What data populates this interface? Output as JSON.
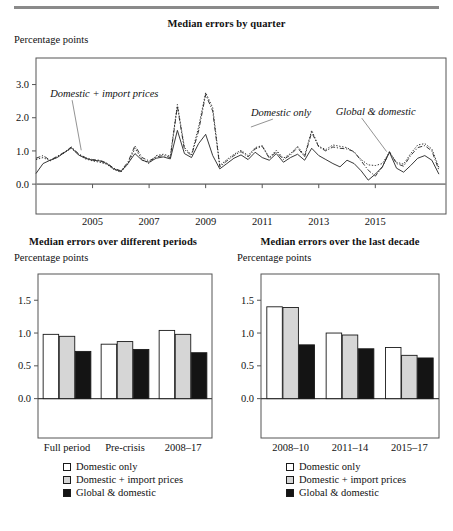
{
  "figure": {
    "axis_unit": "Percentage points",
    "series_names": [
      "Domestic only",
      "Domestic + import prices",
      "Global & domestic"
    ],
    "colors": {
      "domestic_only": "#ffffff",
      "domestic_import": "#d6d6d6",
      "global_domestic": "#141414",
      "line": "#222222",
      "frame": "#555555",
      "rule": "#8a8a8a"
    }
  },
  "legend": {
    "items": [
      {
        "label": "Domestic only",
        "swatch": "white"
      },
      {
        "label": "Domestic + import prices",
        "swatch": "gray"
      },
      {
        "label": "Global & domestic",
        "swatch": "black"
      }
    ]
  },
  "chart_data": [
    {
      "id": "median-errors-by-quarter",
      "type": "line",
      "title": "Median errors by quarter",
      "xlabel": "",
      "ylabel": "Percentage points",
      "ylim": [
        -0.9,
        3.8
      ],
      "yticks": [
        0.0,
        1.0,
        2.0,
        3.0
      ],
      "ytick_labels": [
        "0.0",
        "1.0",
        "2.0",
        "3.0"
      ],
      "xlim": [
        2003.0,
        2017.5
      ],
      "xticks": [
        2005,
        2007,
        2009,
        2011,
        2013,
        2015
      ],
      "xtick_labels": [
        "2005",
        "2007",
        "2009",
        "2011",
        "2013",
        "2015"
      ],
      "grid": false,
      "legend_position": "annotations",
      "annotations": [
        {
          "text": "Domestic + import prices",
          "x": 2003.5,
          "y": 2.62,
          "points_to_x": 2004.6,
          "points_to_y": 1.02
        },
        {
          "text": "Domestic only",
          "x": 2010.6,
          "y": 2.05,
          "points_to_x": 2010.6,
          "points_to_y": 1.72
        },
        {
          "text": "Global & domestic",
          "x": 2013.6,
          "y": 2.08,
          "points_to_x": 2015.4,
          "points_to_y": 0.98
        }
      ],
      "x": [
        2003.0,
        2003.25,
        2003.5,
        2003.75,
        2004.0,
        2004.25,
        2004.5,
        2004.75,
        2005.0,
        2005.25,
        2005.5,
        2005.75,
        2006.0,
        2006.25,
        2006.5,
        2006.75,
        2007.0,
        2007.25,
        2007.5,
        2007.75,
        2008.0,
        2008.25,
        2008.5,
        2008.75,
        2009.0,
        2009.25,
        2009.5,
        2009.75,
        2010.0,
        2010.25,
        2010.5,
        2010.75,
        2011.0,
        2011.25,
        2011.5,
        2011.75,
        2012.0,
        2012.25,
        2012.5,
        2012.75,
        2013.0,
        2013.25,
        2013.5,
        2013.75,
        2014.0,
        2014.25,
        2014.5,
        2014.75,
        2015.0,
        2015.25,
        2015.5,
        2015.75,
        2016.0,
        2016.25,
        2016.5,
        2016.75,
        2017.0,
        2017.25
      ],
      "series": [
        {
          "name": "Domestic only",
          "style": "solid",
          "values": [
            0.32,
            0.62,
            0.72,
            0.8,
            0.95,
            1.1,
            0.88,
            0.78,
            0.72,
            0.7,
            0.62,
            0.46,
            0.38,
            0.62,
            0.92,
            0.72,
            0.66,
            0.78,
            0.82,
            0.76,
            1.62,
            0.92,
            0.8,
            1.22,
            1.5,
            0.86,
            0.46,
            0.62,
            0.78,
            0.88,
            0.74,
            0.96,
            0.8,
            0.72,
            0.92,
            0.66,
            0.8,
            0.9,
            0.72,
            1.08,
            0.86,
            0.74,
            0.62,
            0.52,
            0.72,
            0.62,
            0.4,
            0.12,
            0.3,
            0.52,
            0.96,
            0.48,
            0.36,
            0.56,
            0.78,
            0.86,
            0.72,
            0.3
          ]
        },
        {
          "name": "Domestic + import prices",
          "style": "dashdot",
          "values": [
            0.78,
            0.86,
            0.72,
            0.84,
            0.96,
            1.12,
            0.92,
            0.8,
            0.74,
            0.72,
            0.64,
            0.48,
            0.4,
            0.66,
            1.16,
            0.8,
            0.7,
            0.82,
            0.86,
            0.8,
            2.34,
            1.04,
            0.86,
            1.6,
            2.7,
            2.2,
            0.52,
            0.7,
            0.86,
            0.98,
            0.82,
            1.06,
            1.14,
            0.78,
            0.98,
            0.74,
            0.88,
            1.1,
            0.82,
            1.56,
            1.12,
            1.0,
            1.12,
            1.08,
            1.06,
            0.98,
            0.7,
            0.42,
            0.24,
            0.52,
            0.98,
            0.62,
            0.54,
            0.86,
            1.1,
            1.16,
            1.0,
            0.42
          ]
        },
        {
          "name": "Global & domestic",
          "style": "dotted",
          "values": [
            0.74,
            0.8,
            0.7,
            0.82,
            0.94,
            1.08,
            0.9,
            0.76,
            0.7,
            0.66,
            0.6,
            0.44,
            0.36,
            0.6,
            1.08,
            0.74,
            0.62,
            0.86,
            0.9,
            0.84,
            2.4,
            1.1,
            0.88,
            1.72,
            2.76,
            2.3,
            0.56,
            0.74,
            0.9,
            1.02,
            0.86,
            1.1,
            1.16,
            0.8,
            1.02,
            0.78,
            0.92,
            1.14,
            0.86,
            1.62,
            1.14,
            1.04,
            1.18,
            1.14,
            1.1,
            0.96,
            0.74,
            0.58,
            0.56,
            0.62,
            0.96,
            0.66,
            0.6,
            0.92,
            1.18,
            1.22,
            1.06,
            0.5
          ]
        }
      ]
    },
    {
      "id": "median-errors-over-different-periods",
      "type": "bar",
      "title": "Median errors over different periods",
      "xlabel": "",
      "ylabel": "Percentage points",
      "ylim": [
        -0.6,
        1.9
      ],
      "yticks": [
        0.0,
        0.5,
        1.0,
        1.5
      ],
      "ytick_labels": [
        "0.0",
        "0.5",
        "1.0",
        "1.5"
      ],
      "grid": false,
      "legend_position": "bottom",
      "categories": [
        "Full period",
        "Pre-crisis",
        "2008–17"
      ],
      "series": [
        {
          "name": "Domestic only",
          "values": [
            0.98,
            0.83,
            1.04
          ]
        },
        {
          "name": "Domestic + import prices",
          "values": [
            0.95,
            0.87,
            0.98
          ]
        },
        {
          "name": "Global & domestic",
          "values": [
            0.72,
            0.75,
            0.7
          ]
        }
      ]
    },
    {
      "id": "median-errors-over-the-last-decade",
      "type": "bar",
      "title": "Median errors over the last decade",
      "xlabel": "",
      "ylabel": "Percentage points",
      "ylim": [
        -0.6,
        1.9
      ],
      "yticks": [
        0.0,
        0.5,
        1.0,
        1.5
      ],
      "ytick_labels": [
        "0.0",
        "0.5",
        "1.0",
        "1.5"
      ],
      "grid": false,
      "legend_position": "bottom",
      "categories": [
        "2008–10",
        "2011–14",
        "2015–17"
      ],
      "series": [
        {
          "name": "Domestic only",
          "values": [
            1.4,
            1.0,
            0.78
          ]
        },
        {
          "name": "Domestic + import prices",
          "values": [
            1.39,
            0.97,
            0.66
          ]
        },
        {
          "name": "Global & domestic",
          "values": [
            0.82,
            0.76,
            0.62
          ]
        }
      ]
    }
  ]
}
